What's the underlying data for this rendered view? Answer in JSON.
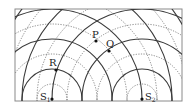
{
  "diagram": {
    "type": "two-source wave interference pattern",
    "frame": {
      "x": 15,
      "y": 9,
      "width": 167,
      "height": 92
    },
    "legend_style": {
      "crest": "solid line",
      "trough": "dotted line"
    },
    "sources": [
      {
        "id": "S1",
        "label": "S",
        "subscript": "1",
        "x": 52,
        "y": 99
      },
      {
        "id": "S2",
        "label": "S",
        "subscript": "2",
        "x": 142,
        "y": 99
      }
    ],
    "crest_radii": [
      30,
      60,
      90,
      120,
      150,
      180
    ],
    "trough_radii": [
      15,
      45,
      75,
      105,
      135,
      165
    ],
    "points": [
      {
        "id": "P",
        "label": "P",
        "x": 96,
        "y": 41,
        "label_x": 92,
        "label_y": 38
      },
      {
        "id": "Q",
        "label": "Q",
        "x": 109,
        "y": 51,
        "label_x": 106,
        "label_y": 47
      },
      {
        "id": "R",
        "label": "R",
        "x": 56,
        "y": 70,
        "label_x": 49,
        "label_y": 66
      }
    ],
    "colors": {
      "crest": "#3a3a3a",
      "trough": "#6a6a6a",
      "frame": "#8a8a8a"
    }
  }
}
